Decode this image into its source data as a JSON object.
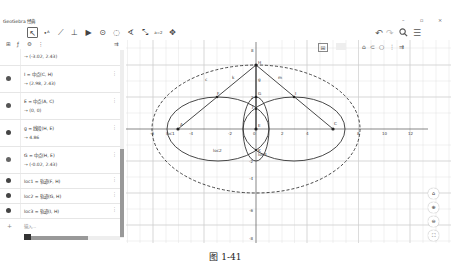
{
  "window": {
    "title": "GeoGebra 经典",
    "controls": {
      "minimize": "–",
      "maximize": "▫",
      "close": "×"
    }
  },
  "toolbar": {
    "tools": [
      {
        "name": "move-tool",
        "glyph": "↖",
        "selected": true
      },
      {
        "name": "point-tool",
        "glyph": "•ᴬ"
      },
      {
        "name": "line-tool",
        "glyph": "⟋"
      },
      {
        "name": "perpendicular-tool",
        "glyph": "⊥"
      },
      {
        "name": "polygon-tool",
        "glyph": "▶"
      },
      {
        "name": "circle-tool",
        "glyph": "⊙"
      },
      {
        "name": "circle-3pt-tool",
        "glyph": "◌"
      },
      {
        "name": "angle-tool",
        "glyph": "∢"
      },
      {
        "name": "reflect-tool",
        "glyph": "⤡"
      },
      {
        "name": "slider-tool",
        "glyph": "a=2"
      },
      {
        "name": "move-view-tool",
        "glyph": "✥"
      }
    ],
    "right": {
      "undo": "↶",
      "redo": "↷",
      "search": "🔍",
      "menu": "☰"
    }
  },
  "algebra": {
    "header_icons": {
      "sort": "⊞",
      "algebra_desc": "ƒ",
      "settings": "⚙",
      "more": "⋮",
      "collapse": "⇉"
    },
    "items": [
      {
        "definition": "",
        "value": "→ (-3.02, 2.43)",
        "partial": true
      },
      {
        "definition": "I = 中点(C, H)",
        "value": "→ (2.98, 2.43)"
      },
      {
        "definition": "E = 中点(A, C)",
        "value": "→ (0, 0)"
      },
      {
        "definition": "g = 线段(H, E)",
        "value": "→ 4.86"
      },
      {
        "definition": "G = 中点(H, E)",
        "value": "→ (-0.02, 2.43)"
      },
      {
        "definition": "loc1 = 轨迹(F, H)",
        "value": ""
      },
      {
        "definition": "loc2 = 轨迹(G, H)",
        "value": ""
      },
      {
        "definition": "loc3 = 轨迹(I, H)",
        "value": ""
      }
    ],
    "input": {
      "icon": "+",
      "placeholder": "输入..."
    }
  },
  "graphics": {
    "style_bar": {
      "axes_grid": "⊞",
      "home": "⌂",
      "undo": "⊂",
      "circle": "○",
      "more": "⋮",
      "toggle": "⇉"
    },
    "nav": {
      "home": "⌂",
      "zoom_in": "⊕",
      "zoom_out": "⊖",
      "fullscreen": "⛶"
    },
    "x_ticks": [
      "-6",
      "-4",
      "-2",
      "0",
      "2",
      "4",
      "6",
      "8",
      "10",
      "12"
    ],
    "y_ticks": [
      "8",
      "4",
      "2",
      "-2",
      "-4",
      "-6",
      "-8"
    ],
    "point_labels": {
      "A": "A",
      "C": "C",
      "E": "E",
      "F": "F",
      "G": "G",
      "H": "H",
      "I": "I",
      "J": "J",
      "K": "K"
    },
    "object_labels": {
      "c": "c",
      "k": "k",
      "m": "m",
      "g": "g",
      "loc1": "loc1",
      "loc2": "loc2",
      "loc3": "loc3"
    }
  },
  "caption": "图 1-41"
}
